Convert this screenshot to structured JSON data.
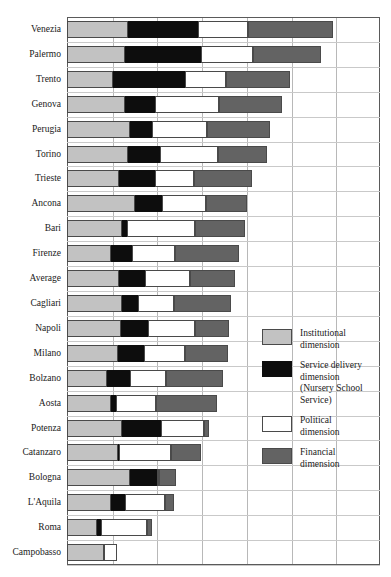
{
  "figure": {
    "title_faint": "",
    "axis_left_px": 67,
    "axis_right_px": 380
  },
  "legend": {
    "position": "right-middle",
    "items": [
      {
        "key": "institutional",
        "label": "Institutional\ndimension",
        "color": "#c2c2c2",
        "swatch_name": "legend-swatch-institutional"
      },
      {
        "key": "service_delivery",
        "label": "Service delivery\ndimension\n(Nursery School\nService)",
        "color": "#0d0d0d",
        "swatch_name": "legend-swatch-service-delivery"
      },
      {
        "key": "political",
        "label": "Political\ndimension",
        "color": "#ffffff",
        "swatch_name": "legend-swatch-political"
      },
      {
        "key": "financial",
        "label": "Financial\ndimension",
        "color": "#636363",
        "swatch_name": "legend-swatch-financial"
      }
    ]
  },
  "chart_data": {
    "type": "bar",
    "orientation": "horizontal",
    "stacked": true,
    "title": "",
    "xlabel": "",
    "ylabel": "",
    "xlim": [
      0,
      7
    ],
    "grid": true,
    "gridlines_x": [
      0,
      1,
      2,
      3,
      4,
      5,
      6,
      7
    ],
    "legend_position": "right",
    "categories": [
      "Venezia",
      "Palermo",
      "Trento",
      "Genova",
      "Perugia",
      "Torino",
      "Trieste",
      "Ancona",
      "Bari",
      "Firenze",
      "Average",
      "Cagliari",
      "Napoli",
      "Milano",
      "Bolzano",
      "Aosta",
      "Potenza",
      "Catanzaro",
      "Bologna",
      "L'Aquila",
      "Roma",
      "Campobasso"
    ],
    "series": [
      {
        "name": "Institutional dimension",
        "color": "#c2c2c2",
        "values": [
          1.36,
          1.29,
          1.02,
          1.29,
          1.4,
          1.36,
          1.16,
          1.53,
          1.24,
          0.98,
          1.16,
          1.22,
          1.2,
          1.13,
          0.89,
          0.98,
          1.22,
          1.13,
          1.4,
          0.98,
          0.67,
          0.82
        ]
      },
      {
        "name": "Service delivery dimension (Nursery School Service)",
        "color": "#0d0d0d",
        "values": [
          1.58,
          1.71,
          1.62,
          0.67,
          0.49,
          0.71,
          0.8,
          0.6,
          0.11,
          0.47,
          0.58,
          0.36,
          0.62,
          0.6,
          0.51,
          0.11,
          0.89,
          0.04,
          0.62,
          0.31,
          0.09,
          0.0
        ]
      },
      {
        "name": "Political dimension",
        "color": "#ffffff",
        "values": [
          1.11,
          1.16,
          0.91,
          1.44,
          1.24,
          1.31,
          0.87,
          0.98,
          1.51,
          0.96,
          1.0,
          0.82,
          1.04,
          0.91,
          0.82,
          0.89,
          0.96,
          1.16,
          0.04,
          0.91,
          1.04,
          0.29
        ]
      },
      {
        "name": "Financial dimension",
        "color": "#636363",
        "values": [
          1.89,
          1.51,
          1.44,
          1.4,
          1.42,
          1.09,
          1.31,
          0.91,
          1.13,
          1.44,
          1.02,
          1.27,
          0.76,
          0.96,
          1.27,
          1.38,
          0.11,
          0.67,
          0.38,
          0.2,
          0.11,
          0.0
        ]
      }
    ]
  }
}
